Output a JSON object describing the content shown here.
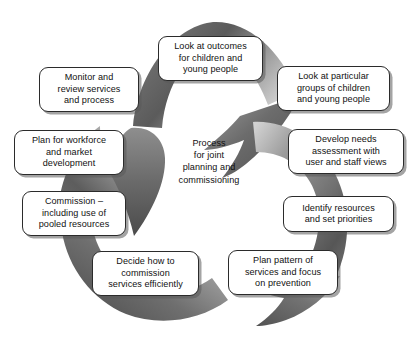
{
  "diagram": {
    "type": "cycle",
    "title_center": "Process\nfor joint\nplanning and\ncommissioning",
    "symbol": "recycling-loop-three-arrows",
    "colors": {
      "arrow_dark": "#5f5f5f",
      "arrow_mid": "#8d8d8d",
      "arrow_light": "#c9c9c9",
      "box_fill": "#ffffff",
      "box_border": "#2b2b2b",
      "text": "#111111",
      "shadow": "#8f8f8f"
    },
    "nodes": [
      {
        "id": "look-at-outcomes",
        "label": "Look at outcomes\nfor children and\nyoung people",
        "x": 158,
        "y": 36,
        "w": 105,
        "h": 45
      },
      {
        "id": "look-at-particular-groups",
        "label": "Look at particular\ngroups of children\nand young people",
        "x": 277,
        "y": 66,
        "w": 113,
        "h": 45
      },
      {
        "id": "develop-needs-assessment",
        "label": "Develop needs\nassessment with\nuser and staff views",
        "x": 288,
        "y": 129,
        "w": 116,
        "h": 45
      },
      {
        "id": "identify-resources",
        "label": "Identify resources\nand set priorities",
        "x": 283,
        "y": 196,
        "w": 111,
        "h": 36
      },
      {
        "id": "plan-pattern-of-services",
        "label": "Plan pattern of\nservices and focus\non prevention",
        "x": 228,
        "y": 250,
        "w": 110,
        "h": 45
      },
      {
        "id": "decide-how-to-commission",
        "label": "Decide how to\ncommission\nservices efficiently",
        "x": 92,
        "y": 251,
        "w": 107,
        "h": 45
      },
      {
        "id": "commission-pooled-resources",
        "label": "Commission –\nincluding use of\npooled resources",
        "x": 22,
        "y": 191,
        "w": 104,
        "h": 45
      },
      {
        "id": "plan-for-workforce",
        "label": "Plan for workforce\nand market\ndevelopment",
        "x": 14,
        "y": 130,
        "w": 110,
        "h": 45
      },
      {
        "id": "monitor-and-review",
        "label": "Monitor and\nreview services\nand process",
        "x": 39,
        "y": 67,
        "w": 100,
        "h": 45
      }
    ],
    "center": {
      "x": 157,
      "y": 137,
      "w": 104,
      "h": 52
    }
  }
}
